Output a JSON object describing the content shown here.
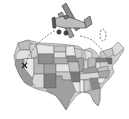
{
  "illustration": {
    "subject": "Biplane flying over a map of the United States",
    "elements": [
      "us-map",
      "biplane",
      "dashed-flight-path",
      "x-marker",
      "loop"
    ],
    "colors": {
      "background": "#ffffff",
      "outline": "#555555",
      "light_gray": "#d6d6d6",
      "mid_gray": "#a8a8a8",
      "dark_gray": "#7e7e7e",
      "lightest": "#ececec"
    }
  }
}
